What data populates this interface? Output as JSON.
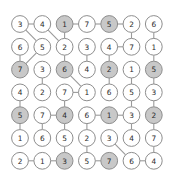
{
  "diagram": {
    "type": "grid-graph",
    "rows": 7,
    "cols": 7,
    "colors": {
      "node_fill_plain": "#ffffff",
      "node_fill_shaded": "#c8c8c8",
      "node_stroke": "#8e8e8e",
      "edge_stroke": "#9a9a9a",
      "label_color": "#2b2b2b",
      "background": "#ffffff"
    },
    "geometry": {
      "x0": 20,
      "y0": 24,
      "dx": 22.3,
      "dy": 22.8,
      "radius": 8.4
    },
    "nodes": [
      {
        "id": "r1c1",
        "row": 1,
        "col": 1,
        "label": "3",
        "shaded": false
      },
      {
        "id": "r1c2",
        "row": 1,
        "col": 2,
        "label": "4",
        "shaded": false
      },
      {
        "id": "r1c3",
        "row": 1,
        "col": 3,
        "label": "1",
        "shaded": true
      },
      {
        "id": "r1c4",
        "row": 1,
        "col": 4,
        "label": "7",
        "shaded": false
      },
      {
        "id": "r1c5",
        "row": 1,
        "col": 5,
        "label": "5",
        "shaded": true
      },
      {
        "id": "r1c6",
        "row": 1,
        "col": 6,
        "label": "2",
        "shaded": false
      },
      {
        "id": "r1c7",
        "row": 1,
        "col": 7,
        "label": "6",
        "shaded": false
      },
      {
        "id": "r2c1",
        "row": 2,
        "col": 1,
        "label": "6",
        "shaded": false
      },
      {
        "id": "r2c2",
        "row": 2,
        "col": 2,
        "label": "5",
        "shaded": false
      },
      {
        "id": "r2c3",
        "row": 2,
        "col": 3,
        "label": "2",
        "shaded": false
      },
      {
        "id": "r2c4",
        "row": 2,
        "col": 4,
        "label": "3",
        "shaded": false
      },
      {
        "id": "r2c5",
        "row": 2,
        "col": 5,
        "label": "4",
        "shaded": false
      },
      {
        "id": "r2c6",
        "row": 2,
        "col": 6,
        "label": "7",
        "shaded": false
      },
      {
        "id": "r2c7",
        "row": 2,
        "col": 7,
        "label": "1",
        "shaded": false
      },
      {
        "id": "r3c1",
        "row": 3,
        "col": 1,
        "label": "7",
        "shaded": true
      },
      {
        "id": "r3c2",
        "row": 3,
        "col": 2,
        "label": "3",
        "shaded": false
      },
      {
        "id": "r3c3",
        "row": 3,
        "col": 3,
        "label": "6",
        "shaded": true
      },
      {
        "id": "r3c4",
        "row": 3,
        "col": 4,
        "label": "4",
        "shaded": false
      },
      {
        "id": "r3c5",
        "row": 3,
        "col": 5,
        "label": "2",
        "shaded": true
      },
      {
        "id": "r3c6",
        "row": 3,
        "col": 6,
        "label": "1",
        "shaded": false
      },
      {
        "id": "r3c7",
        "row": 3,
        "col": 7,
        "label": "5",
        "shaded": true
      },
      {
        "id": "r4c1",
        "row": 4,
        "col": 1,
        "label": "4",
        "shaded": false
      },
      {
        "id": "r4c2",
        "row": 4,
        "col": 2,
        "label": "2",
        "shaded": false
      },
      {
        "id": "r4c3",
        "row": 4,
        "col": 3,
        "label": "7",
        "shaded": false
      },
      {
        "id": "r4c4",
        "row": 4,
        "col": 4,
        "label": "1",
        "shaded": false
      },
      {
        "id": "r4c5",
        "row": 4,
        "col": 5,
        "label": "6",
        "shaded": false
      },
      {
        "id": "r4c6",
        "row": 4,
        "col": 6,
        "label": "5",
        "shaded": false
      },
      {
        "id": "r4c7",
        "row": 4,
        "col": 7,
        "label": "3",
        "shaded": false
      },
      {
        "id": "r5c1",
        "row": 5,
        "col": 1,
        "label": "5",
        "shaded": true
      },
      {
        "id": "r5c2",
        "row": 5,
        "col": 2,
        "label": "7",
        "shaded": false
      },
      {
        "id": "r5c3",
        "row": 5,
        "col": 3,
        "label": "4",
        "shaded": true
      },
      {
        "id": "r5c4",
        "row": 5,
        "col": 4,
        "label": "6",
        "shaded": false
      },
      {
        "id": "r5c5",
        "row": 5,
        "col": 5,
        "label": "1",
        "shaded": true
      },
      {
        "id": "r5c6",
        "row": 5,
        "col": 6,
        "label": "3",
        "shaded": false
      },
      {
        "id": "r5c7",
        "row": 5,
        "col": 7,
        "label": "2",
        "shaded": true
      },
      {
        "id": "r6c1",
        "row": 6,
        "col": 1,
        "label": "1",
        "shaded": false
      },
      {
        "id": "r6c2",
        "row": 6,
        "col": 2,
        "label": "6",
        "shaded": false
      },
      {
        "id": "r6c3",
        "row": 6,
        "col": 3,
        "label": "5",
        "shaded": false
      },
      {
        "id": "r6c4",
        "row": 6,
        "col": 4,
        "label": "2",
        "shaded": false
      },
      {
        "id": "r6c5",
        "row": 6,
        "col": 5,
        "label": "3",
        "shaded": false
      },
      {
        "id": "r6c6",
        "row": 6,
        "col": 6,
        "label": "4",
        "shaded": false
      },
      {
        "id": "r6c7",
        "row": 6,
        "col": 7,
        "label": "7",
        "shaded": false
      },
      {
        "id": "r7c1",
        "row": 7,
        "col": 1,
        "label": "2",
        "shaded": false
      },
      {
        "id": "r7c2",
        "row": 7,
        "col": 2,
        "label": "1",
        "shaded": false
      },
      {
        "id": "r7c3",
        "row": 7,
        "col": 3,
        "label": "3",
        "shaded": true
      },
      {
        "id": "r7c4",
        "row": 7,
        "col": 4,
        "label": "5",
        "shaded": false
      },
      {
        "id": "r7c5",
        "row": 7,
        "col": 5,
        "label": "7",
        "shaded": true
      },
      {
        "id": "r7c6",
        "row": 7,
        "col": 6,
        "label": "6",
        "shaded": false
      },
      {
        "id": "r7c7",
        "row": 7,
        "col": 7,
        "label": "4",
        "shaded": false
      }
    ],
    "edges": [
      {
        "from": "r1c1",
        "to": "r1c2"
      },
      {
        "from": "r1c3",
        "to": "r1c4"
      },
      {
        "from": "r1c4",
        "to": "r1c5"
      },
      {
        "from": "r1c5",
        "to": "r1c6"
      },
      {
        "from": "r1c1",
        "to": "r2c2"
      },
      {
        "from": "r1c2",
        "to": "r2c3"
      },
      {
        "from": "r1c3",
        "to": "r2c3"
      },
      {
        "from": "r1c6",
        "to": "r2c6"
      },
      {
        "from": "r1c7",
        "to": "r2c7"
      },
      {
        "from": "r2c5",
        "to": "r2c6"
      },
      {
        "from": "r2c1",
        "to": "r3c1"
      },
      {
        "from": "r2c2",
        "to": "r3c1"
      },
      {
        "from": "r2c3",
        "to": "r3c3"
      },
      {
        "from": "r2c4",
        "to": "r3c4"
      },
      {
        "from": "r2c5",
        "to": "r3c5"
      },
      {
        "from": "r2c7",
        "to": "r3c7"
      },
      {
        "from": "r3c3",
        "to": "r4c4"
      },
      {
        "from": "r3c2",
        "to": "r4c2"
      },
      {
        "from": "r3c5",
        "to": "r4c5"
      },
      {
        "from": "r3c6",
        "to": "r4c6"
      },
      {
        "from": "r3c7",
        "to": "r4c7"
      },
      {
        "from": "r4c3",
        "to": "r4c4"
      },
      {
        "from": "r4c1",
        "to": "r5c1"
      },
      {
        "from": "r4c3",
        "to": "r5c3"
      },
      {
        "from": "r4c6",
        "to": "r5c6"
      },
      {
        "from": "r4c7",
        "to": "r5c7"
      },
      {
        "from": "r5c2",
        "to": "r5c3"
      },
      {
        "from": "r5c4",
        "to": "r5c5"
      },
      {
        "from": "r5c5",
        "to": "r5c6"
      },
      {
        "from": "r5c1",
        "to": "r6c1"
      },
      {
        "from": "r5c2",
        "to": "r6c2"
      },
      {
        "from": "r5c3",
        "to": "r6c3"
      },
      {
        "from": "r5c4",
        "to": "r6c4"
      },
      {
        "from": "r5c6",
        "to": "r6c6"
      },
      {
        "from": "r5c7",
        "to": "r6c7"
      },
      {
        "from": "r6c3",
        "to": "r7c3"
      },
      {
        "from": "r6c4",
        "to": "r7c4"
      },
      {
        "from": "r6c5",
        "to": "r7c6"
      },
      {
        "from": "r6c7",
        "to": "r7c7"
      },
      {
        "from": "r7c1",
        "to": "r7c2"
      },
      {
        "from": "r7c2",
        "to": "r7c3"
      },
      {
        "from": "r7c4",
        "to": "r7c5"
      },
      {
        "from": "r7c6",
        "to": "r7c7"
      }
    ]
  }
}
